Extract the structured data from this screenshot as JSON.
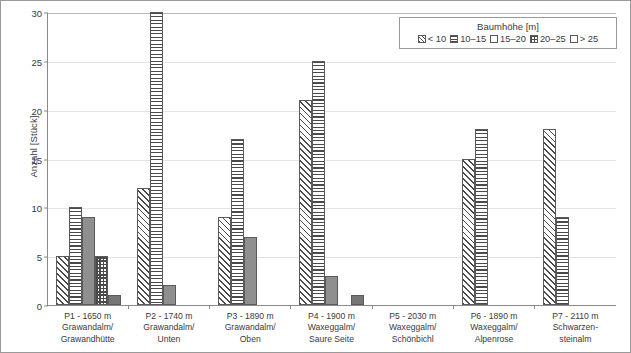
{
  "chart_data": {
    "type": "bar",
    "title": "",
    "xlabel": "",
    "ylabel": "Anzahl [Stück]",
    "ylim": [
      0,
      30
    ],
    "yticks": [
      0,
      5,
      10,
      15,
      20,
      25,
      30
    ],
    "grid": true,
    "legend_position": "top-right",
    "legend_title": "Baumhöhe [m]",
    "categories": [
      "P1 - 1650 m Grawandalm/ Grawandhütte",
      "P2 - 1740 m Grawandalm/ Unten",
      "P3 - 1890 m Grawandalm/ Oben",
      "P4 - 1900 m Waxeggalm/ Saure Seite",
      "P5 - 2030 m Waxeggalm/ Schönbichl",
      "P6 - 1890 m Waxeggalm/ Alpenrose",
      "P7 - 2110 m Schwarzen- steinalm"
    ],
    "category_lines": [
      [
        "P1 - 1650 m",
        "Grawandalm/",
        "Grawandhütte"
      ],
      [
        "P2 - 1740 m",
        "Grawandalm/",
        "Unten"
      ],
      [
        "P3 - 1890 m",
        "Grawandalm/",
        "Oben"
      ],
      [
        "P4 - 1900 m",
        "Waxeggalm/",
        "Saure Seite"
      ],
      [
        "P5 - 2030 m",
        "Waxeggalm/",
        "Schönbichl"
      ],
      [
        "P6 - 1890 m",
        "Waxeggalm/",
        "Alpenrose"
      ],
      [
        "P7 - 2110 m",
        "Schwarzen-",
        "steinalm"
      ]
    ],
    "series": [
      {
        "name": "< 10",
        "pattern": "diagonal-hatch",
        "values": [
          5,
          12,
          9,
          21,
          0,
          15,
          18
        ]
      },
      {
        "name": "10–15",
        "pattern": "horizontal-lines",
        "values": [
          10,
          30,
          17,
          25,
          0,
          18,
          9
        ]
      },
      {
        "name": "15–20",
        "pattern": "solid-mid-gray",
        "values": [
          9,
          2,
          7,
          3,
          0,
          0,
          0
        ]
      },
      {
        "name": "20–25",
        "pattern": "checkerboard",
        "values": [
          5,
          0,
          0,
          0,
          0,
          0,
          0
        ]
      },
      {
        "name": "> 25",
        "pattern": "solid-dark-gray",
        "values": [
          1,
          0,
          0,
          1,
          0,
          0,
          0
        ]
      }
    ]
  },
  "axis": {
    "y_title": "Anzahl [Stück]",
    "y_tick_labels": [
      "0",
      "5",
      "10",
      "15",
      "20",
      "25",
      "30"
    ]
  },
  "legend": {
    "title": "Baumhöhe [m]",
    "items": [
      {
        "label": "< 10"
      },
      {
        "label": "10–15"
      },
      {
        "label": "15–20"
      },
      {
        "label": "20–25"
      },
      {
        "label": "> 25"
      }
    ]
  },
  "colors": {
    "axis": "#8a8a8a",
    "grid": "#e4e4e4",
    "bar_outline": "#5a5a5a",
    "hatch": "#4a4a4a",
    "solid_mid": "#8f8f8f",
    "solid_dark": "#767676",
    "text": "#3a3a3a",
    "figure_border": "#9a9a9a"
  }
}
